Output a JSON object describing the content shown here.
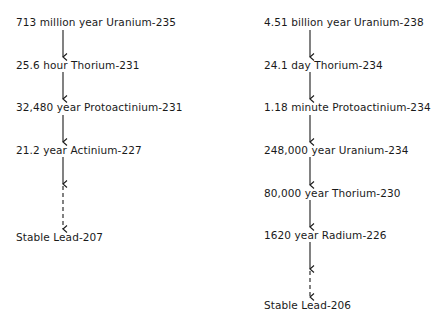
{
  "chains": [
    {
      "name": "uranium-235-series",
      "x": 16,
      "arrow_x": 63,
      "steps": [
        {
          "half_life": "713 million year",
          "isotope": "Uranium-235",
          "y": 16
        },
        {
          "half_life": "25.6 hour",
          "isotope": "Thorium-231",
          "y": 59
        },
        {
          "half_life": "32,480 year",
          "isotope": "Protoactinium-231",
          "y": 101
        },
        {
          "half_life": "21.2 year",
          "isotope": "Actinium-227",
          "y": 144
        },
        {
          "half_life": "Stable",
          "isotope": "Lead-207",
          "y": 231
        }
      ]
    },
    {
      "name": "uranium-238-series",
      "x": 264,
      "arrow_x": 310,
      "steps": [
        {
          "half_life": "4.51 billion year",
          "isotope": "Uranium-238",
          "y": 16
        },
        {
          "half_life": "24.1 day",
          "isotope": "Thorium-234",
          "y": 59
        },
        {
          "half_life": "1.18 minute",
          "isotope": "Protoactinium-234",
          "y": 101
        },
        {
          "half_life": "248,000 year",
          "isotope": "Uranium-234",
          "y": 144
        },
        {
          "half_life": "80,000 year",
          "isotope": "Thorium-230",
          "y": 187
        },
        {
          "half_life": "1620 year",
          "isotope": "Radium-226",
          "y": 229
        },
        {
          "half_life": "Stable",
          "isotope": "Lead-206",
          "y": 299
        }
      ]
    }
  ],
  "labels": {
    "l0": "713 million year Uranium-235",
    "l1": "25.6 hour Thorium-231",
    "l2": "32,480 year Protoactinium-231",
    "l3": "21.2 year Actinium-227",
    "l4": "Stable Lead-207",
    "r0": "4.51 billion year Uranium-238",
    "r1": "24.1 day Thorium-234",
    "r2": "1.18 minute Protoactinium-234",
    "r3": "248,000 year Uranium-234",
    "r4": "80,000 year Thorium-230",
    "r5": "1620 year Radium-226",
    "r6": "Stable Lead-206"
  },
  "arrow_color": "#1a1a1a"
}
